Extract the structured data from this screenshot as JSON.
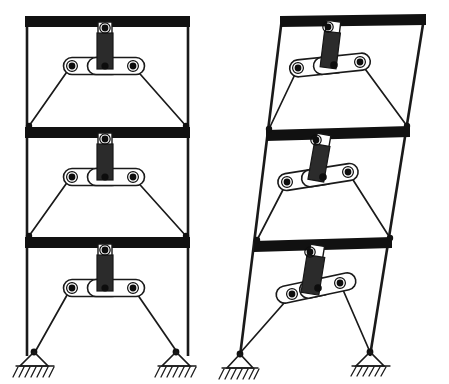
{
  "figure": {
    "background_color": "#ffffff",
    "ink_color": "#111111",
    "width": 449,
    "height": 384,
    "panel_count": 2
  },
  "panels": [
    {
      "id": "left-frame",
      "name": "undeformed-frame",
      "state_label": "undeformed",
      "sway": 0,
      "column_left_top_x": 27,
      "column_right_top_x": 188,
      "column_left_base_x": 27,
      "column_right_base_x": 188
    },
    {
      "id": "right-frame",
      "name": "deformed-frame",
      "state_label": "laterally displaced",
      "sway": 42,
      "column_left_top_x": 282,
      "column_right_top_x": 424,
      "column_left_base_x": 240,
      "column_right_base_x": 370
    }
  ],
  "stories": [
    {
      "index": 1,
      "name": "third-story",
      "beam_y": 16,
      "beam_height": 11
    },
    {
      "index": 2,
      "name": "second-story",
      "beam_y": 127,
      "beam_height": 11
    },
    {
      "index": 3,
      "name": "first-story",
      "beam_y": 237,
      "beam_height": 11
    }
  ],
  "mechanism": {
    "name": "toggle-brace-damper-assembly",
    "parts": [
      "vertical-hanger-link",
      "upper-pin",
      "center-pin",
      "left-toggle-link",
      "right-toggle-link",
      "left-toggle-pin",
      "right-toggle-pin",
      "left-diagonal-brace",
      "right-diagonal-brace"
    ],
    "hanger_fill": "#2b2b2b",
    "toggle_fill": "#ffffff",
    "pin_fill": "#0d0d0d"
  },
  "supports": {
    "name": "pinned-support",
    "count": 4,
    "type": "pin",
    "hatched": true,
    "positions": [
      {
        "panel": "left-frame",
        "x": 34,
        "y": 356
      },
      {
        "panel": "left-frame",
        "x": 176,
        "y": 356
      },
      {
        "panel": "right-frame",
        "x": 240,
        "y": 358
      },
      {
        "panel": "right-frame",
        "x": 370,
        "y": 356
      }
    ]
  }
}
